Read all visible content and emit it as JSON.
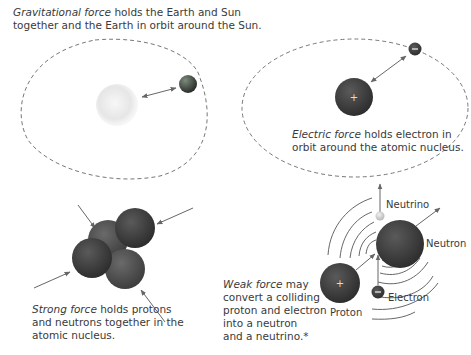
{
  "panels": {
    "gravitational": {
      "term": "Gravitational force",
      "line1_rest": " holds the Earth and Sun",
      "line2": "together and the Earth in orbit around the Sun.",
      "bodies": [
        "Sun",
        "Earth"
      ]
    },
    "electric": {
      "term": "Electric force",
      "line1_rest": " holds electron in",
      "line2": "orbit around the atomic nucleus.",
      "nucleus_sign": "+",
      "electron_sign": "−"
    },
    "strong": {
      "term": "Strong force",
      "line1_rest": " holds protons",
      "line2": "and neutrons together in the",
      "line3": "atomic nucleus."
    },
    "weak": {
      "term": "Weak force",
      "line1_rest": " may",
      "line2": "convert a colliding",
      "line3": "proton and electron",
      "line4": "into a neutron",
      "line5": "and a neutrino.*",
      "labels": {
        "neutrino": "Neutrino",
        "neutron": "Neutron",
        "electron": "Electron",
        "proton": "Proton"
      },
      "proton_sign": "+",
      "electron_sign": "−"
    }
  },
  "colors": {
    "particle_dark": "#3a3a3a",
    "particle_mid": "#555555",
    "orbit": "#666666",
    "arrow": "#666666",
    "sun": "#e6e6e6",
    "text": "#3a3a3a"
  }
}
